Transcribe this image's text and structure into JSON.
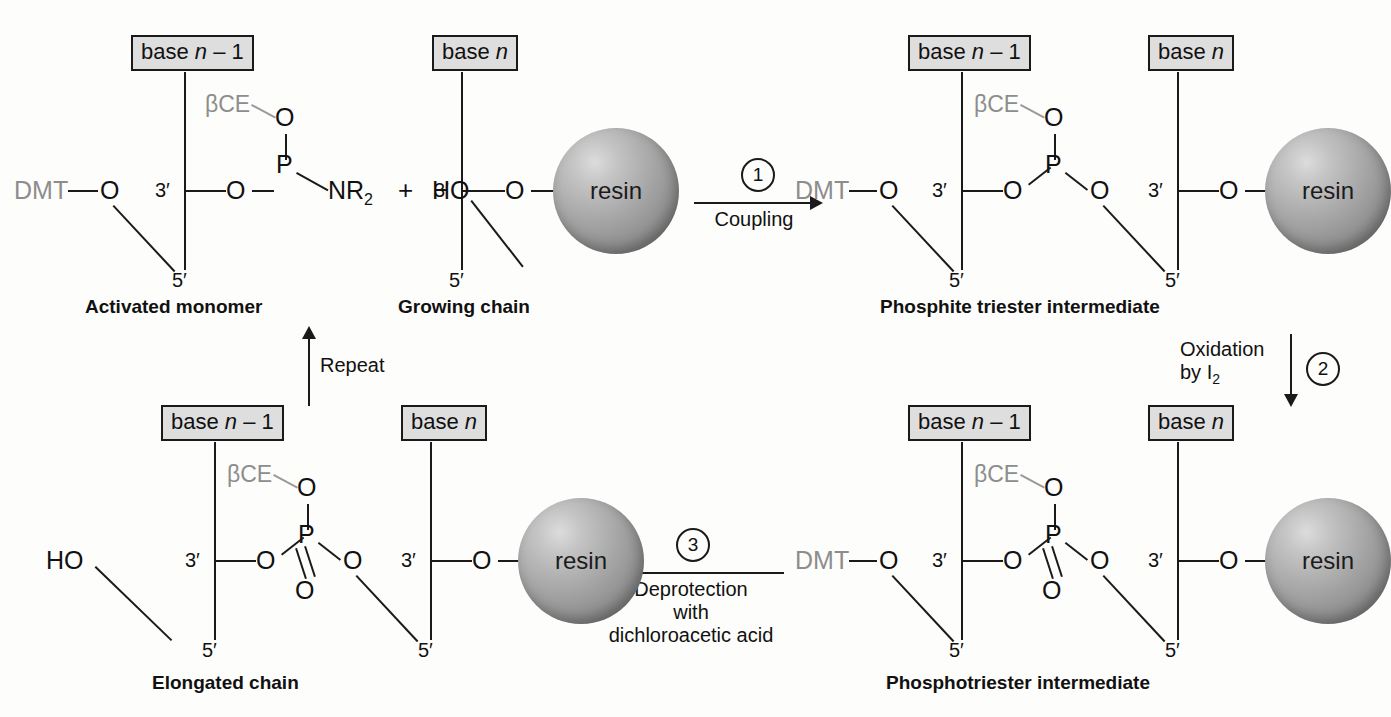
{
  "figure": {
    "background_color": "#fdfdfb",
    "ink_color": "#1a1a1a",
    "gray_label_color": "#8d8d8d",
    "base_box_fill": "#dedede"
  },
  "labels": {
    "base_n_minus_1": "base n – 1",
    "base_n": "base n",
    "base_word": "base ",
    "n_italic": "n",
    "minus_one": " – 1",
    "dmt": "DMT",
    "bce": "βCE",
    "oxygen": "O",
    "phosphorus": "P",
    "nr2": "NR",
    "nr2_sub": "2",
    "ho": "HO",
    "plus": "+",
    "three_prime": "3′",
    "five_prime": "5′",
    "resin": "resin"
  },
  "structures": [
    {
      "id": "activated-monomer",
      "caption": "Activated monomer",
      "base": "base n – 1",
      "five_prime_protection": "DMT",
      "phosphorus_group": "phosphoramidite",
      "substituents": [
        "βCE–O",
        "O",
        "NR2"
      ],
      "has_resin": false,
      "p_double_bond_o": false
    },
    {
      "id": "growing-chain",
      "caption": "Growing chain",
      "base": "base n",
      "five_prime_protection": "HO",
      "has_resin": true,
      "resin_label": "resin",
      "p_double_bond_o": false
    },
    {
      "id": "phosphite-triester-intermediate",
      "caption": "Phosphite triester intermediate",
      "bases": [
        "base n – 1",
        "base n"
      ],
      "five_prime_protection": "DMT",
      "substituents": [
        "βCE–O",
        "O",
        "O"
      ],
      "has_resin": true,
      "resin_label": "resin",
      "p_double_bond_o": false
    },
    {
      "id": "phosphotriester-intermediate",
      "caption": "Phosphotriester intermediate",
      "bases": [
        "base n – 1",
        "base n"
      ],
      "five_prime_protection": "DMT",
      "substituents": [
        "βCE–O",
        "O",
        "O",
        "=O"
      ],
      "has_resin": true,
      "resin_label": "resin",
      "p_double_bond_o": true
    },
    {
      "id": "elongated-chain",
      "caption": "Elongated chain",
      "bases": [
        "base n – 1",
        "base n"
      ],
      "five_prime_protection": "HO",
      "substituents": [
        "βCE–O",
        "O",
        "O",
        "=O"
      ],
      "has_resin": true,
      "resin_label": "resin",
      "p_double_bond_o": true
    }
  ],
  "steps": [
    {
      "number": "1",
      "label": "Coupling",
      "direction": "right",
      "from": "activated-monomer + growing-chain",
      "to": "phosphite-triester-intermediate"
    },
    {
      "number": "2",
      "label_line1": "Oxidation",
      "label_line2": "by I",
      "label_line2_sub": "2",
      "direction": "down",
      "from": "phosphite-triester-intermediate",
      "to": "phosphotriester-intermediate"
    },
    {
      "number": "3",
      "label_line1": "Deprotection",
      "label_line2": "with",
      "label_line3": "dichloroacetic acid",
      "direction": "left",
      "from": "phosphotriester-intermediate",
      "to": "elongated-chain"
    }
  ],
  "repeat_arrow": {
    "label": "Repeat",
    "direction": "up",
    "from": "elongated-chain",
    "to": "growing-chain"
  }
}
